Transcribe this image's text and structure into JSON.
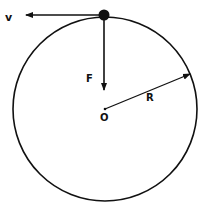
{
  "diagram": {
    "labels": {
      "velocity": "v",
      "force": "F",
      "radius": "R",
      "center": "O"
    },
    "colors": {
      "stroke": "#111111",
      "background": "#ffffff"
    },
    "circle": {
      "cx": 105,
      "cy": 109,
      "r": 92
    },
    "particle": {
      "x": 104,
      "y": 15
    }
  }
}
